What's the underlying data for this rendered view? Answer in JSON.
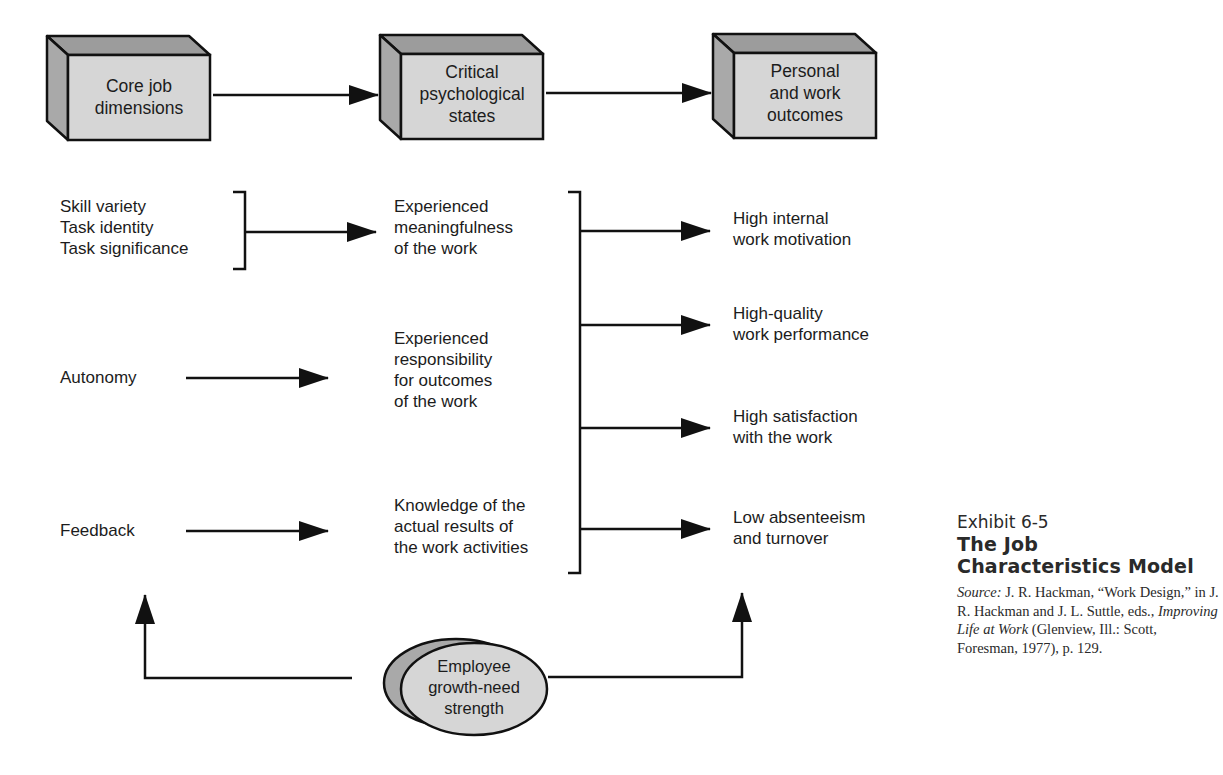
{
  "header_boxes": [
    {
      "label": "Core job\ndimensions"
    },
    {
      "label": "Critical\npsychological\nstates"
    },
    {
      "label": "Personal\nand work\noutcomes"
    }
  ],
  "core_dimensions": {
    "group_1": "Skill variety\nTask identity\nTask significance",
    "autonomy": "Autonomy",
    "feedback": "Feedback"
  },
  "psychological_states": {
    "meaningfulness": "Experienced\nmeaningfulness\nof the work",
    "responsibility": "Experienced\nresponsibility\nfor outcomes\nof the work",
    "knowledge": "Knowledge of the\nactual results of\nthe work activities"
  },
  "outcomes": [
    {
      "label": "High internal\nwork motivation"
    },
    {
      "label": "High-quality\nwork performance"
    },
    {
      "label": "High satisfaction\nwith the work"
    },
    {
      "label": "Low absenteeism\nand turnover"
    }
  ],
  "moderator": {
    "label": "Employee\ngrowth-need\nstrength"
  },
  "caption": {
    "exhibit": "Exhibit 6-5",
    "title_line1": "The Job",
    "title_line2": "Characteristics Model",
    "source_prefix": "Source:",
    "source_part1": " J. R. Hackman, “Work Design,” in J. R. Hackman and J. L. Suttle, eds., ",
    "source_book": "Improving Life at Work",
    "source_part2": " (Glenview, Ill.: Scott, Foresman, 1977), p. 129."
  },
  "colors": {
    "box_front": "#d6d6d6",
    "box_top": "#9c9c9c",
    "box_side": "#a9a9a9",
    "stroke": "#111111"
  }
}
